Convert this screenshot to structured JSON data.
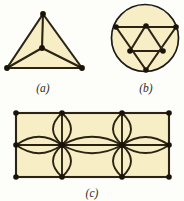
{
  "figure": {
    "background_color": "#fdfdfa",
    "fill_color": "#f7eec6",
    "edge_color": "#2b2414",
    "vertex_color": "#1a1408",
    "circle_outline_color": "#1a1a1a",
    "panels": [
      {
        "id": "a",
        "caption": "(a)",
        "shape": "triangle-with-center-vertex",
        "vertex_count": 4,
        "edge_count": 6,
        "description": "Filled triangle with a central vertex joined to all three corners"
      },
      {
        "id": "b",
        "caption": "(b)",
        "shape": "circle-with-inscribed-subdivided-triangle",
        "vertex_count": 6,
        "edge_count": 9,
        "description": "Filled disc containing a downward triangle subdivided by its midpoint triangle"
      },
      {
        "id": "c",
        "caption": "(c)",
        "shape": "rectangle-with-lens-petals",
        "vertex_count": 10,
        "edge_count": 21,
        "description": "Filled rectangle with two interior vertices, each carrying four lens-shaped petal edges"
      }
    ],
    "captions": {
      "a": "(a)",
      "b": "(b)",
      "c": "(c)"
    }
  },
  "geometry": {
    "panel_a": {
      "apex": [
        43,
        14
      ],
      "bottom_left": [
        7,
        68
      ],
      "bottom_right": [
        82,
        68
      ],
      "center": [
        42,
        48
      ],
      "caption_pos": [
        43,
        90
      ]
    },
    "panel_b": {
      "circle_center": [
        145,
        38
      ],
      "circle_radius": 34,
      "top_left": [
        116,
        27
      ],
      "top_mid": [
        146,
        25
      ],
      "top_right": [
        176,
        27
      ],
      "mid_left": [
        130,
        51
      ],
      "mid_right": [
        163,
        51
      ],
      "bottom": [
        146,
        70
      ],
      "caption_pos": [
        146,
        90
      ]
    },
    "panel_c": {
      "left": 16,
      "right": 169,
      "top": 113,
      "bottom": 177,
      "mid_y": 145,
      "node_x": [
        16,
        62,
        122,
        169
      ],
      "interior_x": [
        62,
        122
      ],
      "petal_half_width": 12,
      "petal_half_height": 15,
      "caption_pos": [
        92,
        196
      ]
    }
  }
}
